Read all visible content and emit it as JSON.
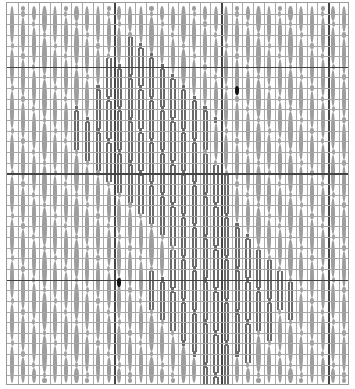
{
  "chart": {
    "title": "",
    "columns": 32,
    "rows": 36,
    "cell_width": 10.7,
    "cell_height": 10.64,
    "thick_columns": [
      10,
      20,
      30
    ],
    "thick_rows_from_top": [
      6,
      16,
      26
    ],
    "colors": {
      "grid": "#a8a8a8",
      "grid_major": "#444444",
      "light_stitch": "#9d9d9d",
      "dark_stitch": "#6a6a6a",
      "marker": "#111111"
    },
    "dark_region": {
      "description": "diamond/heart motif of dark double-bar stitches",
      "upper_lobe": {
        "center_col": 12,
        "center_row": 11,
        "radius": 7
      },
      "center_stem": {
        "center_col": 16,
        "center_row": 17,
        "radius": 4
      },
      "lower_lobe": {
        "center_col": 19,
        "center_row": 27,
        "radius": 7
      }
    },
    "markers": [
      {
        "type": "black-dot",
        "col": 21,
        "row": 8
      },
      {
        "type": "black-dot",
        "col": 10,
        "row": 26
      }
    ],
    "oval_length_rows": 4
  }
}
